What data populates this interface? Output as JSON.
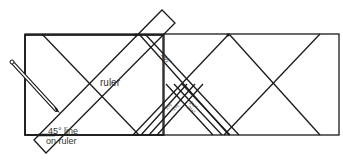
{
  "diagram": {
    "labels": {
      "ruler": "ruler",
      "line_45": "45° line",
      "on_ruler": "on ruler",
      "measure_top": "4½\"",
      "measure_small_1": "2½\"",
      "measure_small_2": "2½\"",
      "measure_small_3": "2½\"",
      "measure_small_4": "2½\""
    },
    "colors": {
      "stroke": "#1a1a1a",
      "background": "#ffffff"
    }
  }
}
